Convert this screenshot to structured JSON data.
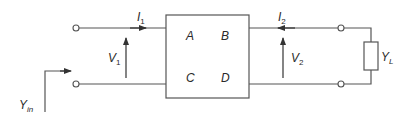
{
  "diagram": {
    "network": {
      "parameters": [
        "A",
        "B",
        "C",
        "D"
      ],
      "param_A": "A",
      "param_B": "B",
      "param_C": "C",
      "param_D": "D"
    },
    "labels": {
      "input_current": "I",
      "input_current_sub": "1",
      "output_current": "I",
      "output_current_sub": "2",
      "input_voltage": "V",
      "input_voltage_sub": "1",
      "output_voltage": "V",
      "output_voltage_sub": "2",
      "load": "Y",
      "load_sub": "L",
      "input_admittance": "Y",
      "input_admittance_sub": "in"
    },
    "colors": {
      "line": "#555555",
      "text": "#2a2a2a"
    }
  }
}
